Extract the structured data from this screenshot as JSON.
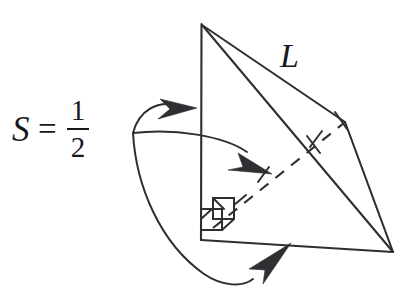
{
  "figure": {
    "background_color": "#ffffff",
    "ink_color": "#2e2f33",
    "labels": {
      "slant_edge": "L",
      "formula_variable": "S",
      "formula_relation": "=",
      "formula_numerator": "1",
      "formula_denominator": "2"
    },
    "annotations": {
      "right_angle_count": 2,
      "tick_mark_count": 4,
      "hidden_edge_style": "dashed",
      "arrow_count": 3
    },
    "vertices": {
      "apex": [
        201,
        24
      ],
      "base_front_left": [
        201,
        240
      ],
      "base_right": [
        393,
        252
      ],
      "base_back_right": [
        345,
        122
      ]
    }
  }
}
